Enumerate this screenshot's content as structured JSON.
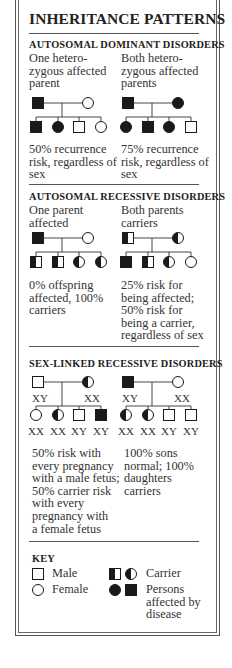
{
  "title": "INHERITANCE PATTERNS",
  "sections": [
    {
      "heading": "AUTOSOMAL DOMINANT DISORDERS",
      "cases": [
        {
          "label_lines": [
            "One hetero-",
            "zygous affected",
            "parent"
          ],
          "parents": [
            {
              "shape": "square",
              "fill": "affected"
            },
            {
              "shape": "circle",
              "fill": "none"
            }
          ],
          "children": [
            {
              "shape": "square",
              "fill": "affected"
            },
            {
              "shape": "circle",
              "fill": "affected"
            },
            {
              "shape": "square",
              "fill": "none"
            },
            {
              "shape": "circle",
              "fill": "none"
            }
          ],
          "caption_lines": [
            "50% recurrence",
            "risk, regardless of",
            "sex"
          ]
        },
        {
          "label_lines": [
            "Both hetero-",
            "zygous affected",
            "parents"
          ],
          "parents": [
            {
              "shape": "square",
              "fill": "affected"
            },
            {
              "shape": "circle",
              "fill": "affected"
            }
          ],
          "children": [
            {
              "shape": "circle",
              "fill": "affected"
            },
            {
              "shape": "square",
              "fill": "affected"
            },
            {
              "shape": "circle",
              "fill": "affected"
            },
            {
              "shape": "square",
              "fill": "none"
            }
          ],
          "caption_lines": [
            "75% recurrence",
            "risk, regardless of",
            "sex"
          ]
        }
      ]
    },
    {
      "heading": "AUTOSOMAL RECESSIVE DISORDERS",
      "cases": [
        {
          "label_lines": [
            "One parent",
            "affected"
          ],
          "parents": [
            {
              "shape": "square",
              "fill": "affected"
            },
            {
              "shape": "circle",
              "fill": "none"
            }
          ],
          "children": [
            {
              "shape": "square",
              "fill": "carrier"
            },
            {
              "shape": "square",
              "fill": "carrier"
            },
            {
              "shape": "circle",
              "fill": "carrier"
            },
            {
              "shape": "circle",
              "fill": "carrier"
            }
          ],
          "caption_lines": [
            "0% offspring",
            "affected, 100%",
            "carriers"
          ]
        },
        {
          "label_lines": [
            "Both parents",
            "carriers"
          ],
          "parents": [
            {
              "shape": "square",
              "fill": "carrier"
            },
            {
              "shape": "circle",
              "fill": "carrier"
            }
          ],
          "children": [
            {
              "shape": "square",
              "fill": "affected"
            },
            {
              "shape": "square",
              "fill": "carrier"
            },
            {
              "shape": "circle",
              "fill": "carrier"
            },
            {
              "shape": "circle",
              "fill": "none"
            }
          ],
          "caption_lines": [
            "25% risk for",
            "being affected;",
            "50% risk for",
            "being a carrier,",
            "regardless of sex"
          ]
        }
      ]
    },
    {
      "heading": "SEX-LINKED RECESSIVE DISORDERS",
      "cases": [
        {
          "parents": [
            {
              "shape": "square",
              "fill": "none",
              "genotype": "XY"
            },
            {
              "shape": "circle",
              "fill": "carrier",
              "genotype": "XX"
            }
          ],
          "children": [
            {
              "shape": "circle",
              "fill": "none",
              "genotype": "XX"
            },
            {
              "shape": "circle",
              "fill": "carrier",
              "genotype": "XX"
            },
            {
              "shape": "square",
              "fill": "none",
              "genotype": "XY"
            },
            {
              "shape": "square",
              "fill": "affected",
              "genotype": "XY"
            }
          ],
          "caption_lines": [
            "50% risk with",
            "every pregnancy",
            "with a male fetus;",
            "50% carrier risk",
            "with every",
            "pregnancy with",
            "a female fetus"
          ]
        },
        {
          "parents": [
            {
              "shape": "square",
              "fill": "affected",
              "genotype": "XY"
            },
            {
              "shape": "circle",
              "fill": "none",
              "genotype": "XX"
            }
          ],
          "children": [
            {
              "shape": "circle",
              "fill": "carrier",
              "genotype": "XX"
            },
            {
              "shape": "circle",
              "fill": "carrier",
              "genotype": "XX"
            },
            {
              "shape": "square",
              "fill": "none",
              "genotype": "XY"
            },
            {
              "shape": "square",
              "fill": "none",
              "genotype": "XY"
            }
          ],
          "caption_lines": [
            "100% sons",
            "normal; 100%",
            "daughters",
            "carriers"
          ]
        }
      ]
    }
  ],
  "key": {
    "heading": "KEY",
    "items": [
      {
        "symbols": [
          "square-empty"
        ],
        "label_lines": [
          "Male"
        ]
      },
      {
        "symbols": [
          "circle-empty"
        ],
        "label_lines": [
          "Female"
        ]
      },
      {
        "symbols": [
          "square-carrier",
          "circle-carrier"
        ],
        "label_lines": [
          "Carrier"
        ]
      },
      {
        "symbols": [
          "circle-affected",
          "square-affected"
        ],
        "label_lines": [
          "Persons",
          "affected by",
          "disease"
        ]
      }
    ]
  },
  "colors": {
    "ink": "#1a1a1a",
    "text": "#333333",
    "border": "#555555",
    "background": "#ffffff"
  }
}
